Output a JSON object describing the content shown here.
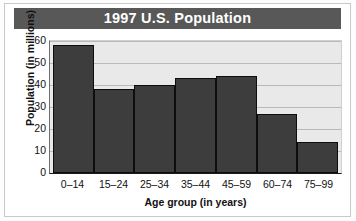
{
  "chart_data": {
    "type": "bar",
    "title": "1997 U.S. Population",
    "xlabel": "Age group (in years)",
    "ylabel": "Population (in millions)",
    "categories": [
      "0–14",
      "15–24",
      "25–34",
      "35–44",
      "45–59",
      "60–74",
      "75–99"
    ],
    "values": [
      58,
      38,
      40,
      43,
      44,
      27,
      14
    ],
    "ylim": [
      0,
      60
    ],
    "yticks": [
      0,
      10,
      20,
      30,
      40,
      50,
      60
    ],
    "ytick_labels": [
      "0",
      "10",
      "20",
      "30",
      "40",
      "50",
      "60"
    ],
    "grid": true,
    "legend": "none",
    "colors": {
      "bar_fill": "#3d3d3d",
      "bar_edge": "#0d0d0d",
      "plot_background": "#e9e9e9",
      "gridline": "#b9b9b9",
      "title_bar": "#585858",
      "title_text": "#ffffff",
      "text": "#111111"
    }
  }
}
